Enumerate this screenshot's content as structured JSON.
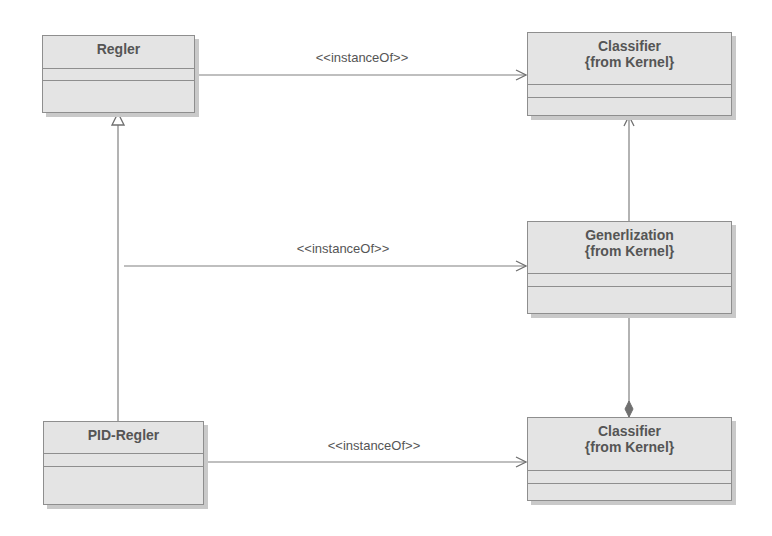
{
  "diagram": {
    "type": "UML class diagram",
    "classes": [
      {
        "id": "regler",
        "name": "Regler",
        "sub": ""
      },
      {
        "id": "classifier-top",
        "name": "Classifier",
        "sub": "{from Kernel}"
      },
      {
        "id": "generalization",
        "name": "Generlization",
        "sub": "{from Kernel}"
      },
      {
        "id": "pid-regler",
        "name": "PID-Regler",
        "sub": ""
      },
      {
        "id": "classifier-bottom",
        "name": "Classifier",
        "sub": "{from Kernel}"
      }
    ],
    "connections": [
      {
        "from": "regler",
        "to": "classifier-top",
        "kind": "dependency",
        "label": "<<instanceOf>>"
      },
      {
        "from": "regler-pid-generalization",
        "to": "generalization",
        "kind": "dependency",
        "label": "<<instanceOf>>"
      },
      {
        "from": "pid-regler",
        "to": "classifier-bottom",
        "kind": "dependency",
        "label": "<<instanceOf>>"
      },
      {
        "from": "pid-regler",
        "to": "regler",
        "kind": "generalization",
        "label": ""
      },
      {
        "from": "generalization",
        "to": "classifier-top",
        "kind": "association",
        "label": ""
      },
      {
        "from": "generalization",
        "to": "classifier-bottom",
        "kind": "composition",
        "label": ""
      }
    ],
    "colors": {
      "box_fill": "#e4e4e4",
      "box_border": "#8e8e8e",
      "shadow": "#c9c9c9",
      "line": "#808080",
      "text": "#555555"
    }
  }
}
